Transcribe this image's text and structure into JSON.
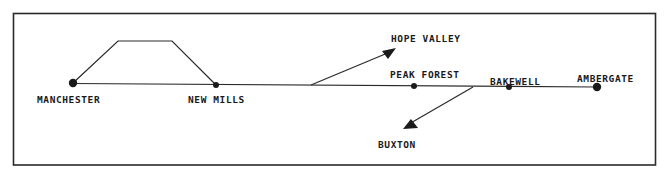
{
  "diagram": {
    "type": "railway-route-schematic",
    "colors": {
      "ink": "#1a1a1a",
      "background": "#ffffff"
    },
    "stations": [
      {
        "id": "manchester",
        "label": "MANCHESTER",
        "x": 73,
        "y": 83,
        "r": 4.2,
        "label_x": 37,
        "label_y": 103
      },
      {
        "id": "new-mills",
        "label": "NEW MILLS",
        "x": 216,
        "y": 85,
        "r": 3,
        "label_x": 188,
        "label_y": 103
      },
      {
        "id": "peak-forest",
        "label": "PEAK FOREST",
        "x": 414,
        "y": 86,
        "r": 3,
        "label_x": 390,
        "label_y": 78
      },
      {
        "id": "bakewell",
        "label": "BAKEWELL",
        "x": 509,
        "y": 87,
        "r": 3,
        "label_x": 490,
        "label_y": 85
      },
      {
        "id": "ambergate",
        "label": "AMBERGATE",
        "x": 597,
        "y": 87,
        "r": 4.2,
        "label_x": 577,
        "label_y": 82
      }
    ],
    "branches": [
      {
        "id": "hope-valley",
        "label": "HOPE VALLEY",
        "direction": "up-right",
        "label_x": 391,
        "label_y": 42
      },
      {
        "id": "buxton",
        "label": "BUXTON",
        "direction": "down-left",
        "label_x": 378,
        "label_y": 148
      }
    ],
    "loop": {
      "description": "alternative route between Manchester and New Mills"
    }
  }
}
